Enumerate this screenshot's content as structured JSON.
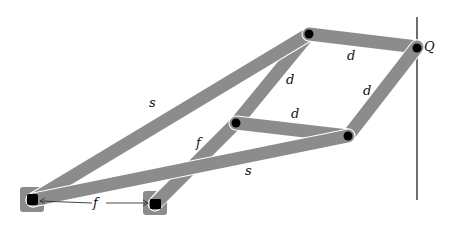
{
  "diagram": {
    "colors": {
      "bar": "#8c8c8c",
      "joint": "#000000",
      "rail": "#222222",
      "background": "#ffffff"
    },
    "points": {
      "A": {
        "x": 33,
        "y": 200,
        "type": "fixed-pivot"
      },
      "B": {
        "x": 155,
        "y": 204,
        "type": "fixed-pivot"
      },
      "C": {
        "x": 309,
        "y": 34,
        "type": "joint"
      },
      "D": {
        "x": 236,
        "y": 123,
        "type": "joint"
      },
      "E": {
        "x": 348,
        "y": 136,
        "type": "joint"
      },
      "Q": {
        "x": 417,
        "y": 47,
        "type": "joint"
      }
    },
    "links": [
      {
        "from": "A",
        "to": "C",
        "label": "s"
      },
      {
        "from": "A",
        "to": "E",
        "label": "s"
      },
      {
        "from": "B",
        "to": "D",
        "label": "f"
      },
      {
        "from": "D",
        "to": "C",
        "label": "d"
      },
      {
        "from": "C",
        "to": "Q",
        "label": "d"
      },
      {
        "from": "Q",
        "to": "E",
        "label": "d"
      },
      {
        "from": "D",
        "to": "E",
        "label": "d"
      }
    ],
    "labels": {
      "s_upper": "s",
      "s_lower": "s",
      "f_link": "f",
      "f_ground": "f",
      "d_top": "d",
      "d_left": "d",
      "d_right": "d",
      "d_inner": "d",
      "q_point": "Q"
    },
    "rail": {
      "x": 417,
      "y_top": 17,
      "y_bottom": 200
    }
  }
}
